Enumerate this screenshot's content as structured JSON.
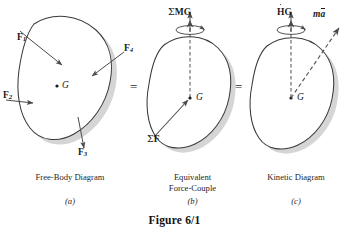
{
  "figure": {
    "title": "Figure 6/1",
    "panels": [
      {
        "id": "a",
        "caption_line1": "Free-Body Diagram",
        "caption_line2": "",
        "subcaption": "(a)",
        "center_point_label": "G",
        "labels": [
          {
            "name": "force-1",
            "base": "F",
            "sub": "1"
          },
          {
            "name": "force-2",
            "base": "F",
            "sub": "2"
          },
          {
            "name": "force-3",
            "base": "F",
            "sub": "3"
          },
          {
            "name": "force-4",
            "base": "F",
            "sub": "4"
          }
        ]
      },
      {
        "id": "b",
        "caption_line1": "Equivalent",
        "caption_line2": "Force-Couple",
        "subcaption": "(b)",
        "center_point_label": "G",
        "moment_sigma": "Σ",
        "moment_base": "M",
        "moment_sub": "G",
        "force_sigma": "Σ",
        "force_base": "F"
      },
      {
        "id": "c",
        "caption_line1": "Kinetic Diagram",
        "caption_line2": "",
        "subcaption": "(c)",
        "center_point_label": "G",
        "momentum_base": "H",
        "momentum_sub": "G",
        "mass_prefix": "m",
        "accel_base": "a"
      }
    ],
    "equals_signs": [
      "=",
      "="
    ],
    "colors": {
      "body_fill": "#ffffff",
      "body_shadow": "#d3d3d3",
      "outline": "#3a3a3a",
      "arrow": "#4a4a4a",
      "dashed_axis": "#555555",
      "text": "#1a1a1a"
    }
  }
}
